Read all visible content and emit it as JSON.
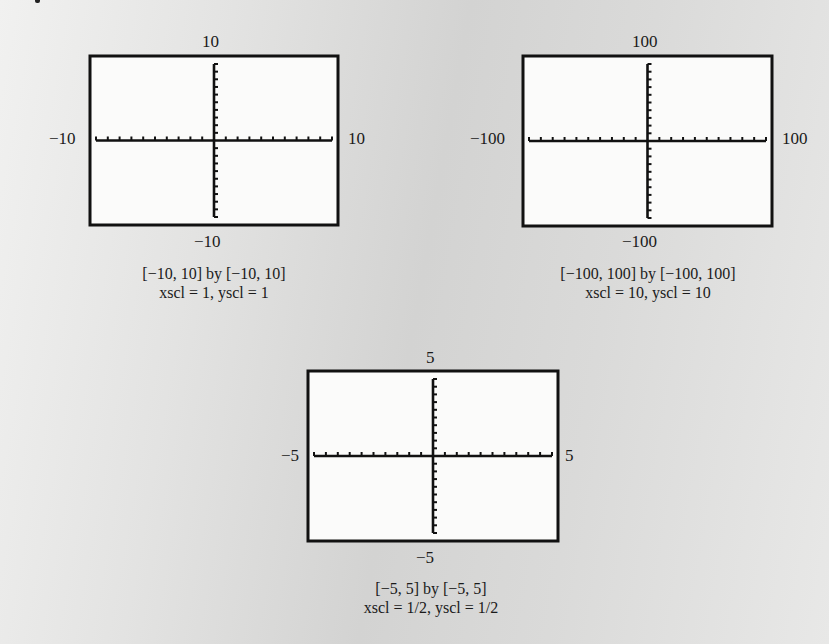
{
  "chart_data": [
    {
      "type": "line",
      "title": "[−10, 10] by [−10, 10]",
      "subtitle": "xscl = 1, yscl = 1",
      "xlim": [
        -10,
        10
      ],
      "ylim": [
        -10,
        10
      ],
      "xscl": 1,
      "yscl": 1,
      "tick_labels": {
        "top": "10",
        "bottom": "−10",
        "left": "−10",
        "right": "10"
      },
      "series": [],
      "grid": false,
      "box": {
        "x": 90,
        "y": 56,
        "w": 248,
        "h": 169
      },
      "ticks_per_side": {
        "x": 10,
        "y": 10
      }
    },
    {
      "type": "line",
      "title": "[−100, 100] by [−100, 100]",
      "subtitle": "xscl = 10, yscl = 10",
      "xlim": [
        -100,
        100
      ],
      "ylim": [
        -100,
        100
      ],
      "xscl": 10,
      "yscl": 10,
      "tick_labels": {
        "top": "100",
        "bottom": "−100",
        "left": "−100",
        "right": "100"
      },
      "series": [],
      "grid": false,
      "box": {
        "x": 523,
        "y": 56,
        "w": 249,
        "h": 170
      },
      "ticks_per_side": {
        "x": 10,
        "y": 10
      }
    },
    {
      "type": "line",
      "title": "[−5, 5] by [−5, 5]",
      "subtitle": "xscl = 1/2,  yscl = 1/2",
      "xlim": [
        -5,
        5
      ],
      "ylim": [
        -5,
        5
      ],
      "xscl": 0.5,
      "yscl": 0.5,
      "tick_labels": {
        "top": "5",
        "bottom": "−5",
        "left": "−5",
        "right": "5"
      },
      "series": [],
      "grid": false,
      "box": {
        "x": 308,
        "y": 371,
        "w": 250,
        "h": 170
      },
      "ticks_per_side": {
        "x": 10,
        "y": 10
      }
    }
  ],
  "plots": [
    {
      "top": "10",
      "bottom": "−10",
      "left": "−10",
      "right": "10",
      "caption1": "[−10, 10] by [−10, 10]",
      "caption2": "xscl = 1, yscl = 1"
    },
    {
      "top": "100",
      "bottom": "−100",
      "left": "−100",
      "right": "100",
      "caption1": "[−100, 100] by [−100, 100]",
      "caption2": "xscl = 10, yscl = 10"
    },
    {
      "top": "5",
      "bottom": "−5",
      "left": "−5",
      "right": "5",
      "caption1": "[−5, 5] by [−5, 5]",
      "caption2": "xscl = 1/2,  yscl = 1/2"
    }
  ],
  "colors": {
    "axis": "#111111",
    "frame": "#111111",
    "screen": "#fbfbfa"
  }
}
